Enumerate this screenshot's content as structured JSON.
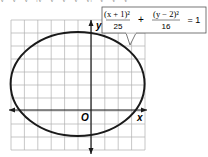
{
  "top_cut_text": "y · y · y · |y · y · y · y · y| · y · y · y",
  "graph": {
    "x_axis_label": "x",
    "y_axis_label": "y",
    "origin_label": "O",
    "grid": {
      "cols": 10,
      "rows": 10,
      "x_min": -7,
      "x_max": 4,
      "y_min": -3,
      "y_max": 7
    }
  },
  "callout": {
    "term1_num": "(x + 1)²",
    "term1_den": "25",
    "plus": "+",
    "term2_num": "(y − 2)²",
    "term2_den": "16",
    "equals": "= 1"
  },
  "ellipse": {
    "h": -1,
    "k": 2,
    "a": 5,
    "b": 4,
    "stroke": "#1a1a1a"
  },
  "colors": {
    "grid": "#b0b0b0",
    "axis": "#1a1a1a",
    "box_border": "#555555"
  }
}
